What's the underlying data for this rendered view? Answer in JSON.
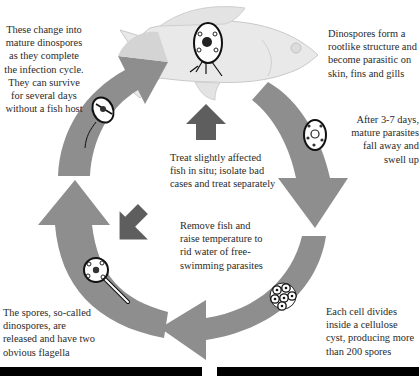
{
  "diagram": {
    "type": "life-cycle",
    "colors": {
      "cycle_arrow": "#8e8e8e",
      "cycle_arrow_light": "#c8c8c8",
      "treatment_arrow": "#5e5e5e",
      "fish_body": "#e9e9e9",
      "fish_outline": "#c9c9c9",
      "background": "#ffffff"
    },
    "stages": [
      {
        "id": "infection",
        "text": "Dinospores form a rootlike structure and become parasitic on skin, fins and gills"
      },
      {
        "id": "fall-away",
        "text": "After 3-7 days, mature parasites fall away and swell up"
      },
      {
        "id": "cyst",
        "text": "Each cell divides inside a cellulose cyst, producing more than 200 spores"
      },
      {
        "id": "release",
        "text": "The spores, so-called dinospores, are released and have two obvious flagella"
      },
      {
        "id": "mature",
        "text": "These change into mature dinospores as they complete the infection cycle. They can survive for several days without a fish host"
      }
    ],
    "treatments": [
      {
        "id": "treat-in-situ",
        "text": "Treat slightly affected fish in situ; isolate bad cases and treat separately"
      },
      {
        "id": "raise-temperature",
        "text": "Remove fish and raise temperature to rid water of free-swimming parasites"
      }
    ]
  }
}
